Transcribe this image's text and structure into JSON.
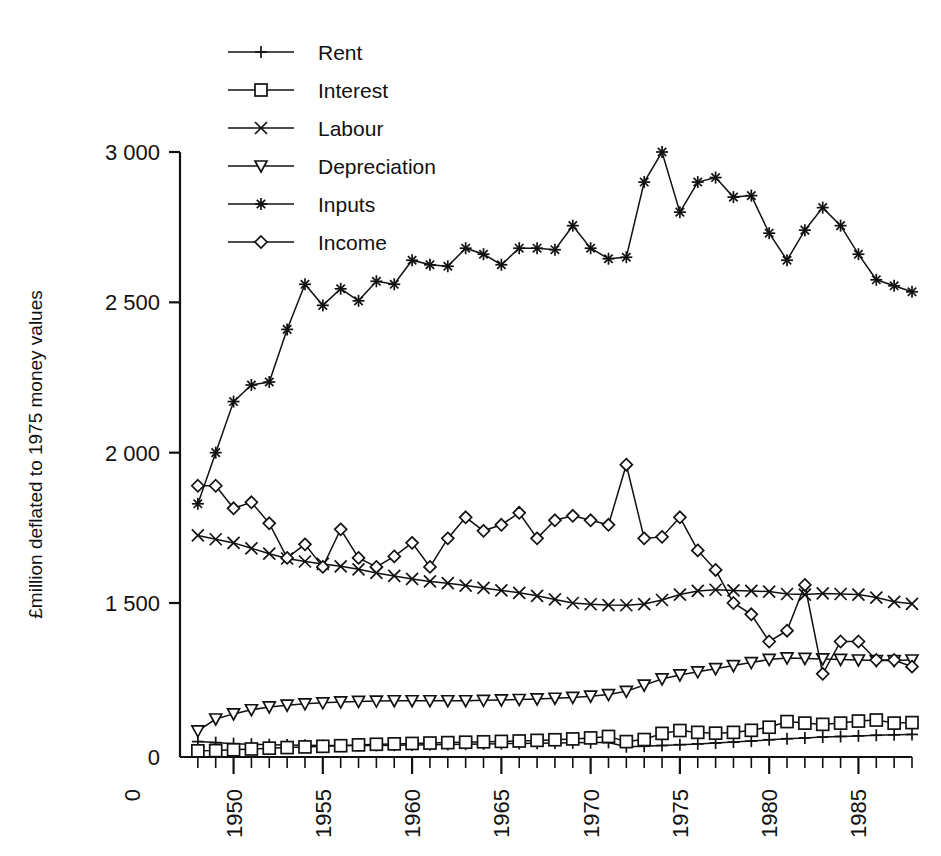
{
  "chart_data": {
    "type": "line",
    "title": "",
    "xlabel": "",
    "ylabel": "£million deflated to 1975 money values",
    "xlim": [
      1947,
      1988
    ],
    "ylim": [
      0,
      3000
    ],
    "grid": false,
    "legend_position": "top-left-inside",
    "y_ticks": [
      0,
      1500,
      2000,
      2500,
      3000
    ],
    "y_tick_labels": [
      "0",
      "1 500",
      "2 000",
      "2 500",
      "3 000"
    ],
    "x_origin_label": "0",
    "x_ticks": [
      1950,
      1955,
      1960,
      1965,
      1970,
      1975,
      1980,
      1985
    ],
    "x_tick_labels": [
      "1950",
      "1955",
      "1960",
      "1965",
      "1970",
      "1975",
      "1980",
      "1985"
    ],
    "x_minor_tick_step": 1,
    "x": [
      1948,
      1949,
      1950,
      1951,
      1952,
      1953,
      1954,
      1955,
      1956,
      1957,
      1958,
      1959,
      1960,
      1961,
      1962,
      1963,
      1964,
      1965,
      1966,
      1967,
      1968,
      1969,
      1970,
      1971,
      1972,
      1973,
      1974,
      1975,
      1976,
      1977,
      1978,
      1979,
      1980,
      1981,
      1982,
      1983,
      1984,
      1985,
      1986,
      1987,
      1988
    ],
    "series": [
      {
        "name": "Rent",
        "marker": "plus",
        "values": [
          150,
          140,
          130,
          125,
          120,
          118,
          115,
          112,
          112,
          112,
          113,
          115,
          118,
          120,
          122,
          125,
          128,
          130,
          132,
          134,
          136,
          138,
          140,
          142,
          100,
          105,
          112,
          120,
          128,
          136,
          145,
          155,
          168,
          178,
          186,
          194,
          200,
          206,
          212,
          216,
          220
        ]
      },
      {
        "name": "Interest",
        "marker": "square",
        "values": [
          60,
          62,
          70,
          78,
          86,
          92,
          98,
          104,
          110,
          118,
          124,
          128,
          132,
          136,
          140,
          144,
          148,
          152,
          156,
          162,
          168,
          176,
          186,
          200,
          150,
          170,
          230,
          258,
          240,
          232,
          240,
          260,
          290,
          345,
          330,
          318,
          330,
          350,
          360,
          330,
          335
        ]
      },
      {
        "name": "Labour",
        "marker": "cross",
        "values": [
          1725,
          1712,
          1700,
          1682,
          1664,
          1648,
          1638,
          1630,
          1622,
          1612,
          1600,
          1590,
          1580,
          1572,
          1566,
          1558,
          1550,
          1542,
          1534,
          1524,
          1512,
          1500,
          1488,
          1480,
          1478,
          1490,
          1510,
          1528,
          1540,
          1544,
          1542,
          1540,
          1538,
          1530,
          1528,
          1532,
          1530,
          1528,
          1518,
          1504,
          1492
        ]
      },
      {
        "name": "Depreciation",
        "marker": "triangle-down",
        "values": [
          255,
          370,
          420,
          460,
          488,
          505,
          518,
          528,
          536,
          542,
          545,
          548,
          548,
          548,
          548,
          548,
          552,
          556,
          560,
          566,
          572,
          580,
          592,
          608,
          640,
          700,
          760,
          800,
          830,
          860,
          890,
          920,
          950,
          965,
          960,
          955,
          950,
          945,
          940,
          940,
          945
        ]
      },
      {
        "name": "Inputs",
        "marker": "star",
        "values": [
          1830,
          2000,
          2170,
          2225,
          2235,
          2410,
          2560,
          2490,
          2545,
          2505,
          2570,
          2560,
          2640,
          2625,
          2620,
          2680,
          2660,
          2625,
          2680,
          2680,
          2675,
          2755,
          2680,
          2645,
          2650,
          2900,
          3000,
          2800,
          2900,
          2915,
          2850,
          2855,
          2730,
          2640,
          2740,
          2815,
          2755,
          2660,
          2575,
          2555,
          2535
        ]
      },
      {
        "name": "Income",
        "marker": "diamond",
        "values": [
          1890,
          1890,
          1815,
          1835,
          1765,
          1650,
          1695,
          1620,
          1745,
          1650,
          1620,
          1655,
          1700,
          1620,
          1715,
          1785,
          1740,
          1760,
          1800,
          1715,
          1775,
          1790,
          1775,
          1760,
          1960,
          1715,
          1720,
          1785,
          1675,
          1610,
          1500,
          1390,
          1125,
          1230,
          1560,
          810,
          1125,
          1125,
          945,
          945,
          880
        ]
      }
    ]
  },
  "legend": {
    "items": [
      {
        "label": "Rent",
        "marker": "plus"
      },
      {
        "label": "Interest",
        "marker": "square"
      },
      {
        "label": "Labour",
        "marker": "cross"
      },
      {
        "label": "Depreciation",
        "marker": "triangle-down"
      },
      {
        "label": "Inputs",
        "marker": "star"
      },
      {
        "label": "Income",
        "marker": "diamond"
      }
    ]
  },
  "colors": {
    "ink": "#111111",
    "background": "#ffffff"
  }
}
